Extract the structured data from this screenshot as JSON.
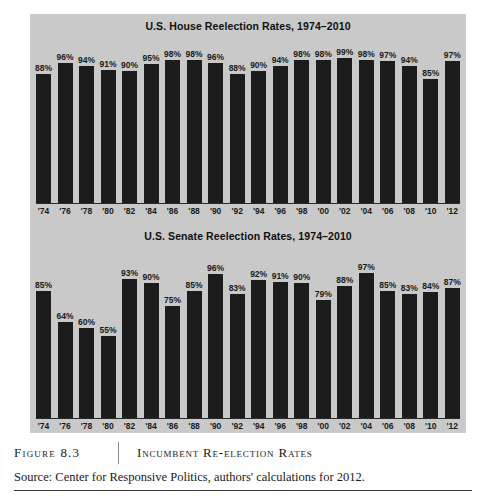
{
  "figure": {
    "number_label": "Figure 8.3",
    "caption": "Incumbent Re-election Rates",
    "source": "Source: Center for Responsive Politics, authors' calculations for 2012."
  },
  "colors": {
    "panel_background": "#c9c9c9",
    "bar": "#1c1c1c",
    "axis": "#2a2a2a",
    "text": "#1a1a1a",
    "page_background": "#ffffff"
  },
  "chart_data": [
    {
      "type": "bar",
      "id": "house",
      "title": "U.S. House Reelection Rates, 1974–2010",
      "xlabel": "",
      "ylabel": "",
      "ylim": [
        0,
        100
      ],
      "grid": false,
      "legend": "none",
      "categories": [
        "'74",
        "'76",
        "'78",
        "'80",
        "'82",
        "'84",
        "'86",
        "'88",
        "'90",
        "'92",
        "'94",
        "'96",
        "'98",
        "'00",
        "'02",
        "'04",
        "'06",
        "'08",
        "'10",
        "'12"
      ],
      "values": [
        88,
        96,
        94,
        91,
        90,
        95,
        98,
        98,
        96,
        88,
        90,
        94,
        98,
        98,
        99,
        98,
        97,
        94,
        85,
        97
      ],
      "data_labels": [
        "88%",
        "96%",
        "94%",
        "91%",
        "90%",
        "95%",
        "98%",
        "98%",
        "96%",
        "88%",
        "90%",
        "94%",
        "98%",
        "98%",
        "99%",
        "98%",
        "97%",
        "94%",
        "85%",
        "97%"
      ]
    },
    {
      "type": "bar",
      "id": "senate",
      "title": "U.S. Senate Reelection Rates, 1974–2010",
      "xlabel": "",
      "ylabel": "",
      "ylim": [
        0,
        100
      ],
      "grid": false,
      "legend": "none",
      "categories": [
        "'74",
        "'76",
        "'78",
        "'80",
        "'82",
        "'84",
        "'86",
        "'88",
        "'90",
        "'92",
        "'94",
        "'96",
        "'98",
        "'00",
        "'02",
        "'04",
        "'06",
        "'08",
        "'10",
        "'12"
      ],
      "values": [
        85,
        64,
        60,
        55,
        93,
        90,
        75,
        85,
        96,
        83,
        92,
        91,
        90,
        79,
        88,
        97,
        85,
        83,
        84,
        87
      ],
      "data_labels": [
        "85%",
        "64%",
        "60%",
        "55%",
        "93%",
        "90%",
        "75%",
        "85%",
        "96%",
        "83%",
        "92%",
        "91%",
        "90%",
        "79%",
        "88%",
        "97%",
        "85%",
        "83%",
        "84%",
        "87%"
      ]
    }
  ]
}
